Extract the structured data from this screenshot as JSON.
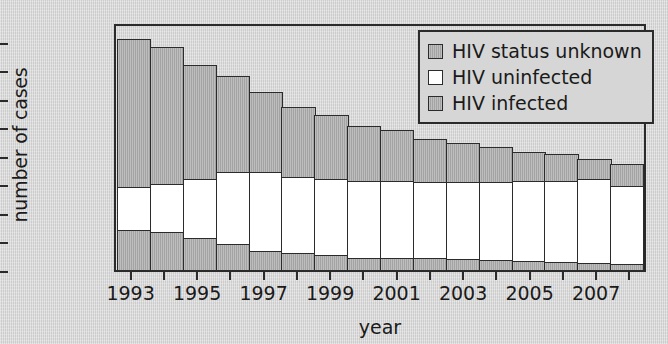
{
  "chart_data": {
    "type": "bar",
    "subtype": "stacked-vertical",
    "title": "",
    "xlabel": "year",
    "ylabel": "number of cases",
    "categories": [
      1993,
      1994,
      1995,
      1996,
      1997,
      1998,
      1999,
      2000,
      2001,
      2002,
      2003,
      2004,
      2005,
      2006,
      2007,
      2008
    ],
    "xtick_labels": [
      "1993",
      "1995",
      "1997",
      "1999",
      "2001",
      "2003",
      "2005",
      "2007"
    ],
    "xtick_years": [
      1993,
      1995,
      1997,
      1999,
      2001,
      2003,
      2005,
      2007
    ],
    "ytick_labels": [
      "0",
      "2000",
      "4000",
      "6000",
      "8000",
      "10000",
      "12000",
      "14000",
      "16000"
    ],
    "ytick_values": [
      0,
      2000,
      4000,
      6000,
      8000,
      10000,
      12000,
      14000,
      16000
    ],
    "ylim": [
      0,
      17400
    ],
    "xlim": [
      1992.5,
      2008.5
    ],
    "grid": false,
    "legend_position": "top-right",
    "series": [
      {
        "name": "HIV infected",
        "color": "#a8a8a8",
        "stack_order": 1,
        "values": [
          2900,
          2750,
          2350,
          1950,
          1400,
          1300,
          1150,
          950,
          950,
          950,
          850,
          800,
          700,
          650,
          600,
          500
        ]
      },
      {
        "name": "HIV uninfected",
        "color": "#ffffff",
        "stack_order": 2,
        "values": [
          3100,
          3500,
          4250,
          5100,
          5650,
          5400,
          5450,
          5500,
          5500,
          5450,
          5550,
          5600,
          5750,
          5800,
          5950,
          5600
        ]
      },
      {
        "name": "HIV status unknown",
        "color": "#a8a8a8",
        "stack_order": 3,
        "values": [
          10500,
          9700,
          8100,
          6850,
          5750,
          5000,
          4600,
          3950,
          3650,
          3100,
          2800,
          2500,
          2150,
          1950,
          1550,
          1600
        ]
      }
    ],
    "totals": [
      16500,
      15950,
      14700,
      13900,
      12800,
      11700,
      11200,
      10400,
      10100,
      9500,
      9200,
      8900,
      8600,
      8400,
      8100,
      7700
    ]
  },
  "legend": {
    "items": [
      {
        "label": "HIV status unknown",
        "swatch": "unknown"
      },
      {
        "label": "HIV uninfected",
        "swatch": "uninfected"
      },
      {
        "label": "HIV infected",
        "swatch": "infected"
      }
    ]
  },
  "axes": {
    "y_title": "number of cases",
    "x_title": "year"
  },
  "colors": {
    "background": "#d3d3d3",
    "axis": "#2a2a2a",
    "gray_fill": "#a8a8a8",
    "white_fill": "#ffffff"
  }
}
